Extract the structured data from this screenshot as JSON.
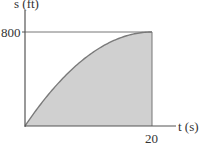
{
  "chart_data": {
    "type": "area",
    "title": "",
    "xlabel": "t (s)",
    "ylabel": "s (ft)",
    "x_ticks": [
      "20"
    ],
    "y_ticks": [
      "800"
    ],
    "xlim": [
      0,
      20
    ],
    "ylim": [
      0,
      800
    ],
    "grid": false,
    "series": [
      {
        "name": "s(t)",
        "x": [
          0,
          2,
          4,
          6,
          8,
          10,
          12,
          14,
          16,
          18,
          20
        ],
        "y": [
          0,
          152,
          288,
          408,
          512,
          600,
          672,
          728,
          768,
          792,
          800
        ]
      }
    ],
    "annotations": [
      "horizontal reference line at s = 800",
      "vertical line at t = 20",
      "area under curve shaded gray"
    ],
    "colors": {
      "fill": "#cfcfcf",
      "curve": "#7a7a7a",
      "axis": "#555555"
    }
  },
  "labels": {
    "y_axis": "s (ft)",
    "x_axis": "t (s)",
    "y_tick": "800",
    "x_tick": "20"
  }
}
